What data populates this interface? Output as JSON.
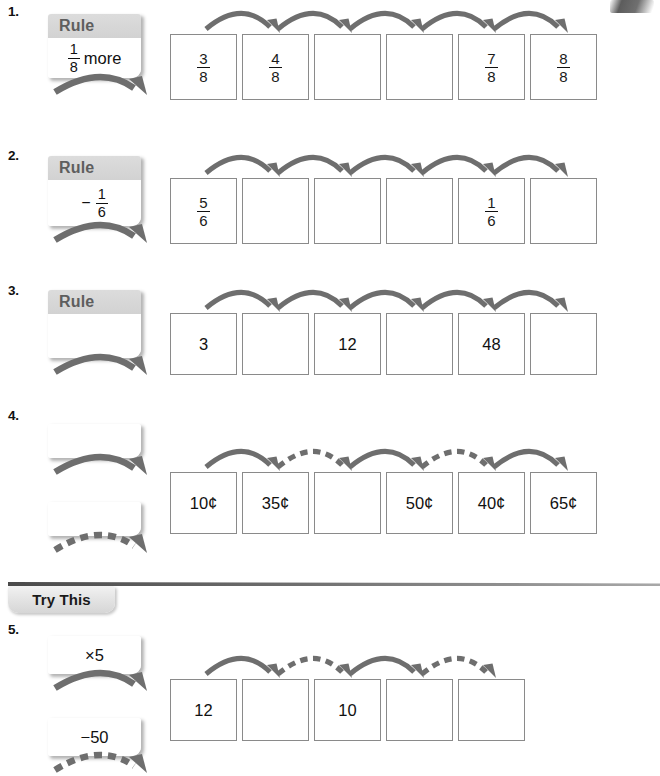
{
  "page": {
    "arrow_color": "#6e6e6e",
    "box_border_color": "#8a8a8a",
    "rule_header_color": "#d6d6d6"
  },
  "section_divider": {
    "label": "Try This"
  },
  "problems": [
    {
      "number": "1.",
      "rule_boxes": [
        {
          "header": "Rule",
          "kind": "fraction_text",
          "numerator": "1",
          "denominator": "8",
          "text": "more",
          "sign": "",
          "arrow_style": "solid"
        }
      ],
      "cells": [
        {
          "kind": "fraction",
          "numerator": "3",
          "denominator": "8"
        },
        {
          "kind": "fraction",
          "numerator": "4",
          "denominator": "8"
        },
        {
          "kind": "blank",
          "value": ""
        },
        {
          "kind": "blank",
          "value": ""
        },
        {
          "kind": "fraction",
          "numerator": "7",
          "denominator": "8"
        },
        {
          "kind": "fraction",
          "numerator": "8",
          "denominator": "8"
        }
      ],
      "arrows": [
        "solid",
        "solid",
        "solid",
        "solid",
        "solid"
      ]
    },
    {
      "number": "2.",
      "rule_boxes": [
        {
          "header": "Rule",
          "kind": "fraction_text",
          "numerator": "1",
          "denominator": "6",
          "text": "",
          "sign": "−",
          "arrow_style": "solid"
        }
      ],
      "cells": [
        {
          "kind": "fraction",
          "numerator": "5",
          "denominator": "6"
        },
        {
          "kind": "blank",
          "value": ""
        },
        {
          "kind": "blank",
          "value": ""
        },
        {
          "kind": "blank",
          "value": ""
        },
        {
          "kind": "fraction",
          "numerator": "1",
          "denominator": "6"
        },
        {
          "kind": "blank",
          "value": ""
        }
      ],
      "arrows": [
        "solid",
        "solid",
        "solid",
        "solid",
        "solid"
      ]
    },
    {
      "number": "3.",
      "rule_boxes": [
        {
          "header": "Rule",
          "kind": "empty",
          "numerator": "",
          "denominator": "",
          "text": "",
          "sign": "",
          "arrow_style": "solid"
        }
      ],
      "cells": [
        {
          "kind": "text",
          "value": "3"
        },
        {
          "kind": "blank",
          "value": ""
        },
        {
          "kind": "text",
          "value": "12"
        },
        {
          "kind": "blank",
          "value": ""
        },
        {
          "kind": "text",
          "value": "48"
        },
        {
          "kind": "blank",
          "value": ""
        }
      ],
      "arrows": [
        "solid",
        "solid",
        "solid",
        "solid",
        "solid"
      ]
    },
    {
      "number": "4.",
      "rule_boxes": [
        {
          "header": "",
          "kind": "empty",
          "numerator": "",
          "denominator": "",
          "text": "",
          "sign": "",
          "arrow_style": "solid"
        },
        {
          "header": "",
          "kind": "empty",
          "numerator": "",
          "denominator": "",
          "text": "",
          "sign": "",
          "arrow_style": "dashed"
        }
      ],
      "cells": [
        {
          "kind": "text",
          "value": "10¢"
        },
        {
          "kind": "text",
          "value": "35¢"
        },
        {
          "kind": "blank",
          "value": ""
        },
        {
          "kind": "text",
          "value": "50¢"
        },
        {
          "kind": "text",
          "value": "40¢"
        },
        {
          "kind": "text",
          "value": "65¢"
        }
      ],
      "arrows": [
        "solid",
        "dashed",
        "solid",
        "dashed",
        "solid"
      ]
    },
    {
      "number": "5.",
      "rule_boxes": [
        {
          "header": "",
          "kind": "text",
          "numerator": "",
          "denominator": "",
          "text": "×5",
          "sign": "",
          "arrow_style": "solid"
        },
        {
          "header": "",
          "kind": "text",
          "numerator": "",
          "denominator": "",
          "text": "−50",
          "sign": "",
          "arrow_style": "dashed"
        }
      ],
      "cells": [
        {
          "kind": "text",
          "value": "12"
        },
        {
          "kind": "blank",
          "value": ""
        },
        {
          "kind": "text",
          "value": "10"
        },
        {
          "kind": "blank",
          "value": ""
        },
        {
          "kind": "blank",
          "value": ""
        }
      ],
      "arrows": [
        "solid",
        "dashed",
        "solid",
        "dashed"
      ]
    }
  ]
}
